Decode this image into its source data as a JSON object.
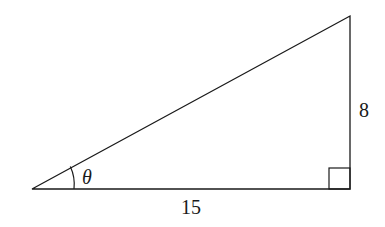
{
  "diagram": {
    "type": "right-triangle",
    "angle_label": "θ",
    "opposite_side_label": "8",
    "adjacent_side_label": "15",
    "right_angle_marker": true,
    "stroke_color": "#1a1a1a",
    "vertices": {
      "angle_vertex": [
        32,
        189
      ],
      "right_angle_vertex": [
        350,
        189
      ],
      "top_vertex": [
        350,
        16
      ]
    }
  }
}
